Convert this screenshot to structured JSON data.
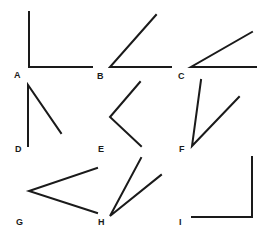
{
  "labels": {
    "A": "A",
    "B": "B",
    "C": "C",
    "D": "D",
    "E": "E",
    "F": "F",
    "G": "G",
    "H": "H",
    "I": "I"
  },
  "stroke_color": "#1a1a1a",
  "background": "#ffffff"
}
